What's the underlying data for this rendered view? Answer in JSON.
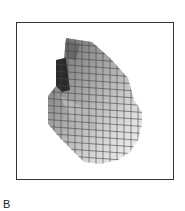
{
  "figure": {
    "panel_label": "B",
    "colors": {
      "frame": "#333333",
      "mesh": "#444444",
      "dark_shade": "#222222"
    }
  }
}
